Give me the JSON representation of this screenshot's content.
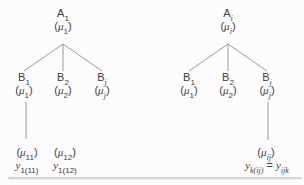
{
  "colors": {
    "background": "#fcfcfc",
    "text": "#3d3d3d",
    "line": "#9a9a9a",
    "rule_dark": "#c4c4c4",
    "rule_light": "#f5f5f5"
  },
  "trees": [
    {
      "root": {
        "name": [
          {
            "t": "A"
          },
          {
            "t": "1",
            "sub": true
          }
        ],
        "mu": [
          {
            "t": "("
          },
          {
            "t": "μ",
            "it": true
          },
          {
            "t": "1",
            "sub": true
          },
          {
            "t": ")"
          }
        ]
      },
      "children": [
        {
          "name": [
            {
              "t": "B"
            },
            {
              "t": "1",
              "sub": true
            }
          ],
          "mu": [
            {
              "t": "("
            },
            {
              "t": "μ",
              "it": true
            },
            {
              "t": "1",
              "sub": true
            },
            {
              "t": ")"
            }
          ]
        },
        {
          "name": [
            {
              "t": "B"
            },
            {
              "t": "2",
              "sub": true
            }
          ],
          "mu": [
            {
              "t": "("
            },
            {
              "t": "μ",
              "it": true
            },
            {
              "t": "2",
              "sub": true
            },
            {
              "t": ")"
            }
          ]
        },
        {
          "name": [
            {
              "t": "B"
            },
            {
              "t": "j",
              "sub": true,
              "it": true
            }
          ],
          "mu": [
            {
              "t": "("
            },
            {
              "t": "μ",
              "it": true
            },
            {
              "t": "j",
              "sub": true,
              "it": true
            },
            {
              "t": ")"
            }
          ]
        }
      ],
      "leaves": [
        {
          "mu": [
            {
              "t": "("
            },
            {
              "t": "μ",
              "it": true
            },
            {
              "t": "11",
              "sub": true
            },
            {
              "t": ")"
            }
          ],
          "y": [
            {
              "t": "y",
              "it": true
            },
            {
              "t": "1(11)",
              "sub": true
            }
          ]
        },
        {
          "mu": [
            {
              "t": "("
            },
            {
              "t": "μ",
              "it": true
            },
            {
              "t": "12",
              "sub": true
            },
            {
              "t": ")"
            }
          ],
          "y": [
            {
              "t": "y",
              "it": true
            },
            {
              "t": "1(12)",
              "sub": true
            }
          ]
        }
      ]
    },
    {
      "root": {
        "name": [
          {
            "t": "A"
          },
          {
            "t": "i",
            "sub": true,
            "it": true
          }
        ],
        "mu": [
          {
            "t": "("
          },
          {
            "t": "μ",
            "it": true
          },
          {
            "t": "i",
            "sub": true,
            "it": true
          },
          {
            "t": ")"
          }
        ]
      },
      "children": [
        {
          "name": [
            {
              "t": "B"
            },
            {
              "t": "1",
              "sub": true
            }
          ],
          "mu": [
            {
              "t": "("
            },
            {
              "t": "μ",
              "it": true
            },
            {
              "t": "1",
              "sub": true
            },
            {
              "t": ")"
            }
          ]
        },
        {
          "name": [
            {
              "t": "B"
            },
            {
              "t": "2",
              "sub": true
            }
          ],
          "mu": [
            {
              "t": "("
            },
            {
              "t": "μ",
              "it": true
            },
            {
              "t": "2",
              "sub": true
            },
            {
              "t": ")"
            }
          ]
        },
        {
          "name": [
            {
              "t": "B"
            },
            {
              "t": "j",
              "sub": true,
              "it": true
            }
          ],
          "mu": [
            {
              "t": "("
            },
            {
              "t": "μ",
              "it": true
            },
            {
              "t": "j",
              "sub": true,
              "it": true
            },
            {
              "t": ")"
            }
          ]
        }
      ],
      "leaves": [
        {
          "mu": [
            {
              "t": "("
            },
            {
              "t": "μ",
              "it": true
            },
            {
              "t": "ij",
              "sub": true,
              "it": true
            },
            {
              "t": ")"
            }
          ],
          "y": [
            {
              "t": "y",
              "it": true
            },
            {
              "t": "k(ij)",
              "sub": true,
              "it": true
            },
            {
              "t": " = "
            },
            {
              "t": "y",
              "it": true
            },
            {
              "t": "ijk",
              "sub": true,
              "it": true
            }
          ]
        }
      ]
    }
  ]
}
